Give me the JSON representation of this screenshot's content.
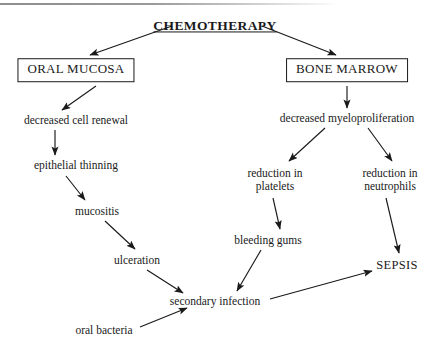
{
  "diagram": {
    "title": "CHEMOTHERAPY",
    "nodes": [
      {
        "id": "chemotherapy",
        "label": "CHEMOTHERAPY",
        "x": 215,
        "y": 26,
        "style": "title"
      },
      {
        "id": "oral-mucosa",
        "label": "ORAL MUCOSA",
        "x": 76,
        "y": 70,
        "style": "boxed"
      },
      {
        "id": "bone-marrow",
        "label": "BONE MARROW",
        "x": 347,
        "y": 70,
        "style": "boxed"
      },
      {
        "id": "cell-renewal",
        "label": "decreased cell renewal",
        "x": 76,
        "y": 120,
        "style": "plain"
      },
      {
        "id": "myeloprolif",
        "label": "decreased myeloproliferation",
        "x": 347,
        "y": 118,
        "style": "plain"
      },
      {
        "id": "epithelial",
        "label": "epithelial thinning",
        "x": 76,
        "y": 165,
        "style": "plain"
      },
      {
        "id": "platelets",
        "label": "reduction in platelets",
        "x": 275,
        "y": 180,
        "style": "two-line"
      },
      {
        "id": "neutrophils",
        "label": "reduction in neutrophils",
        "x": 390,
        "y": 180,
        "style": "two-line"
      },
      {
        "id": "mucositis",
        "label": "mucositis",
        "x": 97,
        "y": 211,
        "style": "plain"
      },
      {
        "id": "bleeding-gums",
        "label": "bleeding gums",
        "x": 268,
        "y": 240,
        "style": "plain"
      },
      {
        "id": "ulceration",
        "label": "ulceration",
        "x": 137,
        "y": 260,
        "style": "plain"
      },
      {
        "id": "sepsis",
        "label": "SEPSIS",
        "x": 397,
        "y": 265,
        "style": "sepsis"
      },
      {
        "id": "secondary-inf",
        "label": "secondary infection",
        "x": 215,
        "y": 301,
        "style": "plain"
      },
      {
        "id": "oral-bacteria",
        "label": "oral bacteria",
        "x": 104,
        "y": 330,
        "style": "plain"
      }
    ],
    "edges": [
      {
        "from": "chemotherapy",
        "to": "oral-mucosa",
        "x1": 172,
        "y1": 26,
        "x2": 90,
        "y2": 55
      },
      {
        "from": "chemotherapy",
        "to": "bone-marrow",
        "x1": 262,
        "y1": 26,
        "x2": 336,
        "y2": 55
      },
      {
        "from": "oral-mucosa",
        "to": "cell-renewal",
        "x1": 96,
        "y1": 86,
        "x2": 62,
        "y2": 110
      },
      {
        "from": "bone-marrow",
        "to": "myeloprolif",
        "x1": 347,
        "y1": 86,
        "x2": 347,
        "y2": 108
      },
      {
        "from": "cell-renewal",
        "to": "epithelial",
        "x1": 55,
        "y1": 130,
        "x2": 55,
        "y2": 155
      },
      {
        "from": "epithelial",
        "to": "mucositis",
        "x1": 66,
        "y1": 176,
        "x2": 85,
        "y2": 200
      },
      {
        "from": "mucositis",
        "to": "ulceration",
        "x1": 105,
        "y1": 221,
        "x2": 135,
        "y2": 249
      },
      {
        "from": "ulceration",
        "to": "secondary-inf",
        "x1": 147,
        "y1": 270,
        "x2": 183,
        "y2": 293
      },
      {
        "from": "myeloprolif",
        "to": "platelets",
        "x1": 325,
        "y1": 128,
        "x2": 289,
        "y2": 161
      },
      {
        "from": "myeloprolif",
        "to": "neutrophils",
        "x1": 368,
        "y1": 128,
        "x2": 392,
        "y2": 161
      },
      {
        "from": "platelets",
        "to": "bleeding-gums",
        "x1": 273,
        "y1": 198,
        "x2": 280,
        "y2": 229
      },
      {
        "from": "neutrophils",
        "to": "sepsis",
        "x1": 386,
        "y1": 198,
        "x2": 399,
        "y2": 253
      },
      {
        "from": "bleeding-gums",
        "to": "secondary-inf",
        "x1": 261,
        "y1": 250,
        "x2": 237,
        "y2": 291
      },
      {
        "from": "oral-bacteria",
        "to": "secondary-inf",
        "x1": 140,
        "y1": 327,
        "x2": 187,
        "y2": 308
      },
      {
        "from": "secondary-inf",
        "to": "sepsis",
        "x1": 270,
        "y1": 299,
        "x2": 372,
        "y2": 271
      }
    ],
    "colors": {
      "ink": "#1a1a1a",
      "background": "#ffffff",
      "rule": "#8d8d8f"
    }
  }
}
